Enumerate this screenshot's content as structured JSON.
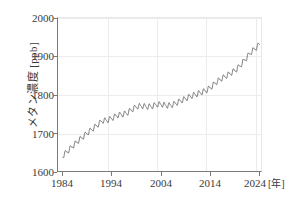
{
  "chart_data": {
    "type": "line",
    "title": "",
    "subtitle": "",
    "xlabel": "年",
    "xlabel_display": "[年]",
    "ylabel": "メタン濃度 [ppb]",
    "xlim": [
      1983.0,
      2024.5
    ],
    "ylim": [
      1600,
      2000
    ],
    "xticks": [
      1984,
      1994,
      2004,
      2014,
      2024
    ],
    "xtick_labels": [
      "1984",
      "1994",
      "2004",
      "2014",
      "2024"
    ],
    "yticks": [
      1600,
      1700,
      1800,
      1900,
      2000
    ],
    "ytick_labels": [
      "1600",
      "1700",
      "1800",
      "1900",
      "2000"
    ],
    "grid": true,
    "legend": "none",
    "line_color": "#5a5a5a",
    "line_width": 0.8,
    "series": [
      {
        "name": "globally averaged atmospheric methane (CH4) mole fraction",
        "units": "ppb",
        "description": "monthly mean with seasonal cycle, annual sawtooth oscillation of about 12 ppb amplitude superimposed on a rising trend",
        "seasonal_amplitude_ppb": 12,
        "x": [
          1984.0,
          1985.0,
          1986.0,
          1987.0,
          1988.0,
          1989.0,
          1990.0,
          1991.0,
          1992.0,
          1993.0,
          1994.0,
          1995.0,
          1996.0,
          1997.0,
          1998.0,
          1999.0,
          2000.0,
          2001.0,
          2002.0,
          2003.0,
          2004.0,
          2005.0,
          2006.0,
          2007.0,
          2008.0,
          2009.0,
          2010.0,
          2011.0,
          2012.0,
          2013.0,
          2014.0,
          2015.0,
          2016.0,
          2017.0,
          2018.0,
          2019.0,
          2020.0,
          2021.0,
          2022.0,
          2023.0,
          2023.8
        ],
        "values": [
          1645,
          1657,
          1670,
          1682,
          1693,
          1704,
          1714,
          1724,
          1735,
          1736,
          1742,
          1749,
          1751,
          1755,
          1764,
          1772,
          1773,
          1771,
          1772,
          1777,
          1777,
          1774,
          1775,
          1781,
          1787,
          1793,
          1799,
          1803,
          1808,
          1813,
          1822,
          1834,
          1843,
          1850,
          1858,
          1866,
          1879,
          1895,
          1911,
          1922,
          1932
        ]
      }
    ]
  },
  "axes": {
    "y_title": "メタン濃度 [ppb]",
    "x_unit_label": "[年]"
  }
}
